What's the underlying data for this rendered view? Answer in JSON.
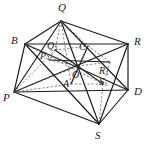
{
  "figure": {
    "kind": "geometry-diagram",
    "stroke_color": "#1a1a1a",
    "dashed_color": "#555555",
    "background": "#ffffff",
    "width": 149,
    "height": 145
  },
  "labels": {
    "Q": {
      "text": "Q",
      "sub": "",
      "x": 58,
      "y": 2,
      "size": "main"
    },
    "B": {
      "text": "B",
      "sub": "",
      "x": 11,
      "y": 35,
      "size": "main"
    },
    "R": {
      "text": "R",
      "sub": "",
      "x": 134,
      "y": 36,
      "size": "main"
    },
    "P": {
      "text": "P",
      "sub": "",
      "x": 3,
      "y": 92,
      "size": "main"
    },
    "D": {
      "text": "D",
      "sub": "",
      "x": 134,
      "y": 86,
      "size": "main"
    },
    "S": {
      "text": "S",
      "sub": "",
      "x": 95,
      "y": 130,
      "size": "main"
    },
    "Q1": {
      "text": "Q",
      "sub": "1",
      "x": 47,
      "y": 41,
      "size": "sub"
    },
    "C": {
      "text": "C",
      "sub": "",
      "x": 79,
      "y": 42,
      "size": "sub"
    },
    "P1": {
      "text": "P",
      "sub": "1",
      "x": 40,
      "y": 51,
      "size": "sub"
    },
    "O": {
      "text": "O",
      "sub": "",
      "x": 72,
      "y": 70,
      "size": "sub"
    },
    "R1": {
      "text": "R",
      "sub": "1",
      "x": 99,
      "y": 66,
      "size": "sub"
    },
    "A": {
      "text": "A",
      "sub": "",
      "x": 63,
      "y": 79,
      "size": "sub"
    },
    "S1": {
      "text": "S",
      "sub": "1",
      "x": 99,
      "y": 77,
      "size": "sub"
    }
  },
  "points": {
    "Q": {
      "x": 61,
      "y": 21
    },
    "B": {
      "x": 25,
      "y": 44
    },
    "R": {
      "x": 128,
      "y": 44
    },
    "P": {
      "x": 14,
      "y": 92
    },
    "D": {
      "x": 128,
      "y": 90
    },
    "S": {
      "x": 99,
      "y": 124
    },
    "Q1": {
      "x": 55,
      "y": 50
    },
    "C": {
      "x": 88,
      "y": 46
    },
    "P1": {
      "x": 49,
      "y": 60
    },
    "O": {
      "x": 78,
      "y": 66
    },
    "R1": {
      "x": 110,
      "y": 62
    },
    "A": {
      "x": 71,
      "y": 84
    },
    "S1": {
      "x": 103,
      "y": 84
    }
  }
}
